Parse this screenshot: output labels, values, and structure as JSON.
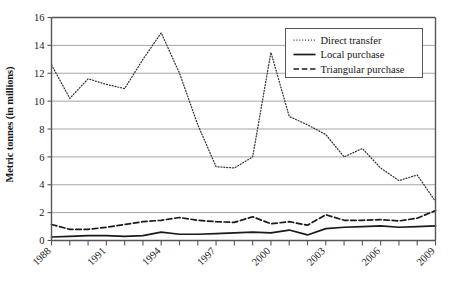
{
  "chart_data": {
    "type": "line",
    "title": "",
    "xlabel": "",
    "ylabel": "Metric tonnes (in millions)",
    "x": [
      1988,
      1989,
      1990,
      1991,
      1992,
      1993,
      1994,
      1995,
      1996,
      1997,
      1998,
      1999,
      2000,
      2001,
      2002,
      2003,
      2004,
      2005,
      2006,
      2007,
      2008,
      2009
    ],
    "xtick_labels": [
      "1988",
      "1991",
      "1994",
      "1997",
      "2000",
      "2003",
      "2006",
      "2009"
    ],
    "xtick_values": [
      1988,
      1991,
      1994,
      1997,
      2000,
      2003,
      2006,
      2009
    ],
    "ytick_labels": [
      "0",
      "2",
      "4",
      "6",
      "8",
      "10",
      "12",
      "14",
      "16"
    ],
    "ytick_values": [
      0,
      2,
      4,
      6,
      8,
      10,
      12,
      14,
      16
    ],
    "xlim": [
      1988,
      2009
    ],
    "ylim": [
      0,
      16
    ],
    "grid": "horizontal",
    "legend_position": "upper right",
    "series": [
      {
        "name": "Direct transfer",
        "style": "dotted",
        "color": "#333333",
        "values": [
          12.6,
          10.2,
          11.6,
          11.2,
          10.9,
          13.0,
          14.9,
          12.0,
          8.3,
          5.3,
          5.2,
          6.0,
          13.5,
          8.9,
          8.3,
          7.6,
          6.0,
          6.6,
          5.2,
          4.3,
          4.7,
          2.8
        ]
      },
      {
        "name": "Local purchase",
        "style": "solid",
        "color": "#1a1a1a",
        "values": [
          0.25,
          0.3,
          0.35,
          0.35,
          0.3,
          0.35,
          0.6,
          0.45,
          0.45,
          0.5,
          0.55,
          0.6,
          0.55,
          0.75,
          0.4,
          0.85,
          0.95,
          1.0,
          1.05,
          0.95,
          1.0,
          1.05
        ]
      },
      {
        "name": "Triangular purchase",
        "style": "dashed",
        "color": "#1a1a1a",
        "values": [
          1.15,
          0.8,
          0.8,
          0.95,
          1.15,
          1.35,
          1.45,
          1.65,
          1.45,
          1.35,
          1.3,
          1.7,
          1.2,
          1.35,
          1.1,
          1.85,
          1.45,
          1.45,
          1.5,
          1.4,
          1.6,
          2.15
        ]
      }
    ]
  },
  "legend": {
    "items": [
      {
        "label": "Direct transfer"
      },
      {
        "label": "Local purchase"
      },
      {
        "label": "Triangular purchase"
      }
    ]
  },
  "caption": {
    "partial_text": ""
  }
}
